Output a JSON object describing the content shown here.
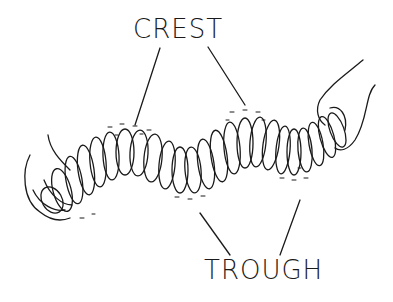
{
  "diagram": {
    "labels": {
      "crest": "CREST",
      "trough": "TROUGH"
    },
    "colors": {
      "ink": "#1a1a1a",
      "background": "#ffffff"
    }
  }
}
